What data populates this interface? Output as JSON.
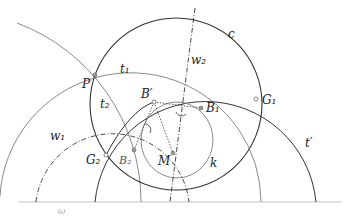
{
  "diagram": {
    "labels": {
      "c": "c",
      "t1": "t₁",
      "t2": "t₂",
      "w1": "w₁",
      "w2": "w₂",
      "P": "P",
      "B_prime": "B′",
      "B1": "B₁",
      "B2": "B₂",
      "G1": "G₁",
      "G2": "G₂",
      "M": "M",
      "k": "k",
      "t_prime": "t′",
      "omega": "ω"
    },
    "colors": {
      "dark": "#333333",
      "gray": "#8a8a8a",
      "baseline": "#bbbbbb"
    }
  }
}
